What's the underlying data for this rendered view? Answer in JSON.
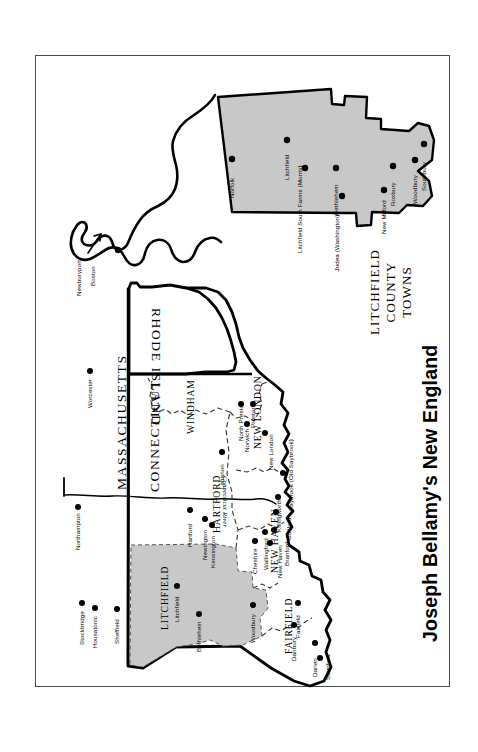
{
  "title": "Joseph Bellamy's New England",
  "colors": {
    "shade_fill": "#c8c8c8",
    "outline": "#000000",
    "frame": "#4a4a4a",
    "background": "#ffffff"
  },
  "inset": {
    "caption_lines": [
      "LITCHFIELD",
      "COUNTY",
      "TOWNS"
    ],
    "towns": [
      {
        "name": "Norfolk"
      },
      {
        "name": "Litchfield"
      },
      {
        "name": "Litchfield South Farms (Morris)"
      },
      {
        "name": "Bethlehem"
      },
      {
        "name": "Judea (Washington)"
      },
      {
        "name": "New Milford"
      },
      {
        "name": "Roxbury"
      },
      {
        "name": "Woodbury"
      },
      {
        "name": "Southbury"
      }
    ]
  },
  "main_map": {
    "states": [
      "MASSACHUSETTS",
      "CONNECTICUT",
      "RHODE ISLAND"
    ],
    "counties": [
      "LITCHFIELD",
      "HARTFORD",
      "WINDHAM",
      "NEW LONDON",
      "NEW HAVEN",
      "FAIRFIELD"
    ],
    "river": "Connecticut River",
    "massachusetts_towns": [
      "Northampton",
      "Worcester",
      "Stockbridge",
      "Housatonic",
      "Sheffield"
    ],
    "boston_area": {
      "arrow_label": "Newburyport",
      "city": "Boston"
    },
    "connecticut_towns": [
      "Litchfield",
      "Bethlehem",
      "Woodbury",
      "Hartford",
      "Newington",
      "Kensington",
      "Lebanon",
      "North Preston",
      "Preston",
      "Norwich",
      "New London",
      "Saybrook (Old Saybrook)",
      "Killingworth",
      "Guilford",
      "Branford",
      "Cheshire",
      "Wallingford",
      "New Haven",
      "Danbury",
      "Fairfield",
      "Darien",
      "Stamford"
    ]
  }
}
